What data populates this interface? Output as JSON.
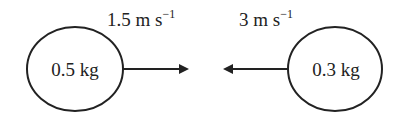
{
  "diagram": {
    "left_body": {
      "mass_label": "0.5 kg",
      "velocity_label": "1.5 m s",
      "velocity_exp": "−1",
      "direction": "right"
    },
    "right_body": {
      "mass_label": "0.3 kg",
      "velocity_label": "3 m s",
      "velocity_exp": "−1",
      "direction": "left"
    },
    "colors": {
      "stroke": "#222222",
      "background": "#ffffff"
    }
  }
}
